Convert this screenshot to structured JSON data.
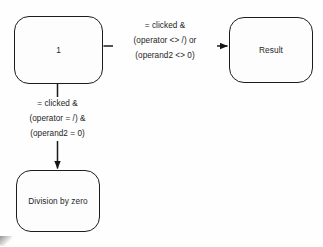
{
  "diagram": {
    "type": "state-transition-diagram",
    "states": [
      {
        "id": "start",
        "label": "1"
      },
      {
        "id": "result",
        "label": "Result"
      },
      {
        "id": "divzero",
        "label_line1": "Division by",
        "label_line2": "zero"
      }
    ],
    "transitions": [
      {
        "id": "to-result",
        "from": "1",
        "to": "Result",
        "direction": "right",
        "guard_line1": "= clicked &",
        "guard_line2": "(operator <> /) or",
        "guard_line3": "(operand2 <> 0)"
      },
      {
        "id": "to-divzero",
        "from": "1",
        "to": "Division by zero",
        "direction": "down",
        "guard_line1": "= clicked &",
        "guard_line2": "(operator = /) &",
        "guard_line3": "(operand2 = 0)"
      }
    ],
    "colors": {
      "background": "#fefefe",
      "stroke": "#1c1c1c",
      "text": "#1d1d1d"
    }
  }
}
